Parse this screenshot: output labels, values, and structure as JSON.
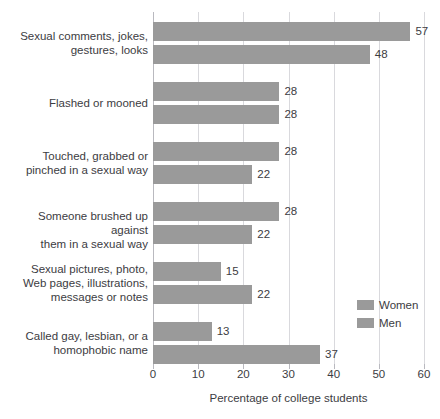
{
  "chart_data": {
    "type": "bar",
    "orientation": "horizontal",
    "title": "",
    "xlabel": "Percentage of college students",
    "ylabel": "",
    "xlim": [
      0,
      60
    ],
    "xticks": [
      0,
      10,
      20,
      30,
      40,
      50,
      60
    ],
    "xtick_labels": [
      "0",
      "10",
      "20",
      "30",
      "40",
      "50",
      "60"
    ],
    "grid": "vertical",
    "legend_position": "bottom-right",
    "bar_color": "#9a9a9a",
    "gridline_color": "#d9d9dd",
    "categories": [
      "Sexual comments, jokes,\ngestures, looks",
      "Flashed or mooned",
      "Touched, grabbed or\npinched in a sexual way",
      "Someone brushed up against\nthem in a sexual way",
      "Sexual pictures, photo,\nWeb pages, illustrations,\nmessages or notes",
      "Called gay, lesbian, or a\nhomophobic name"
    ],
    "series": [
      {
        "name": "Women",
        "values": [
          57,
          28,
          28,
          28,
          15,
          13
        ]
      },
      {
        "name": "Men",
        "values": [
          48,
          28,
          22,
          22,
          22,
          37
        ]
      }
    ],
    "value_labels": {
      "Women": [
        "57",
        "28",
        "28",
        "28",
        "15",
        "13"
      ],
      "Men": [
        "48",
        "28",
        "22",
        "22",
        "22",
        "37"
      ]
    }
  },
  "legend": {
    "entries": [
      {
        "label": "Women",
        "color": "#9a9a9a"
      },
      {
        "label": "Men",
        "color": "#9a9a9a"
      }
    ]
  }
}
